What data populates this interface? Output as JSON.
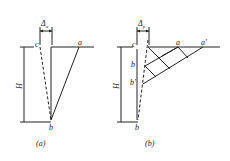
{
  "figure": {
    "line_color": "#222222",
    "background": "#ffffff",
    "panels": [
      {
        "id": "a",
        "caption": "(a)",
        "delta_symbol": "Δ",
        "delta_subscript": "a",
        "height_label": "H",
        "points": {
          "a": "a",
          "b": "b",
          "c": "c"
        }
      },
      {
        "id": "b",
        "caption": "(b)",
        "delta_symbol": "Δ",
        "delta_subscript": "p",
        "height_label": "H",
        "points": {
          "a": "a",
          "a_prime": "a'",
          "b": "b",
          "b_prime": "b'",
          "b_bottom": "b",
          "c": "c"
        }
      }
    ]
  }
}
